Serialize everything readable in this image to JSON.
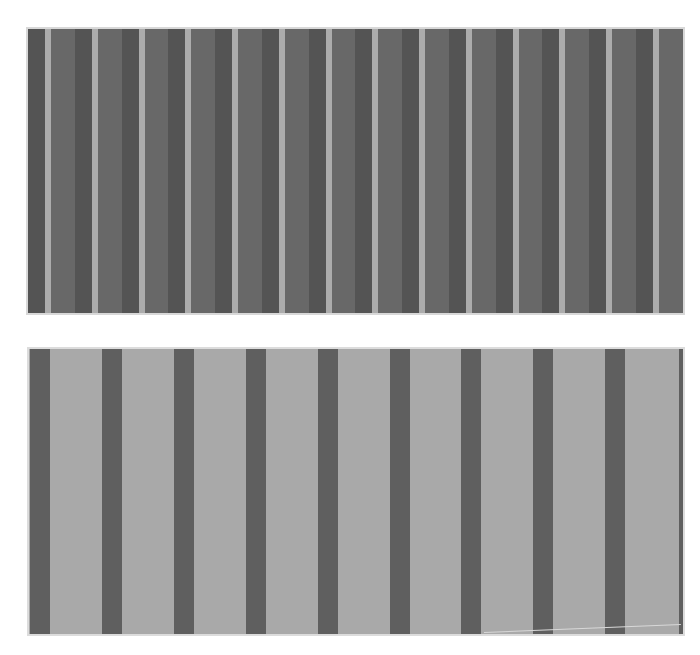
{
  "image": {
    "description": "Two grayscale vertical stripe pattern panels",
    "background": "#ffffff"
  },
  "panels": [
    {
      "name": "top-stripe-panel",
      "x": 28,
      "y": 29,
      "width": 655,
      "height": 284,
      "frame_color": "#d8d8d8",
      "base_color": "#676767",
      "period": 46.75,
      "offset": 0,
      "pattern": [
        {
          "role": "dark-band",
          "start": 0,
          "width": 17,
          "color": "#545454"
        },
        {
          "role": "light-stripe",
          "start": 17,
          "width": 6,
          "color": "#acacac"
        },
        {
          "role": "mid-band",
          "start": 23,
          "width": 23.75,
          "color": "#686868"
        }
      ],
      "repeat_count": 15
    },
    {
      "name": "bottom-stripe-panel",
      "x": 29,
      "y": 349,
      "width": 654,
      "height": 285,
      "frame_color": "#dcdcdc",
      "base_color": "#a9a9a9",
      "period": 71.9,
      "offset": 1,
      "pattern": [
        {
          "role": "dark-bar",
          "start": 0,
          "width": 20,
          "color": "#5f5f5f"
        }
      ],
      "repeat_count": 9,
      "right_edge_strip": {
        "width": 4,
        "color": "#5f5f5f"
      },
      "diagonal_line": {
        "x1": 455,
        "y1": 283,
        "x2": 652,
        "y2": 275,
        "color": "#d8d8d8"
      }
    }
  ]
}
